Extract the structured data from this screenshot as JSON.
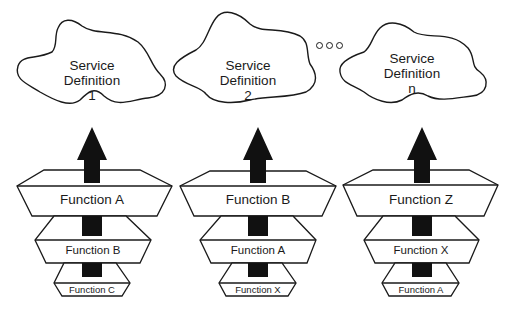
{
  "diagram": {
    "stroke_color": "#1a1a1a",
    "fill_color": "#ffffff",
    "arrow_color": "#111111",
    "columns": [
      {
        "cloud": {
          "line1": "Service",
          "line2": "Definition",
          "line3": "1"
        },
        "functions": {
          "top": "Function A",
          "middle": "Function B",
          "bottom": "Function C"
        }
      },
      {
        "cloud": {
          "line1": "Service",
          "line2": "Definition",
          "line3": "2"
        },
        "functions": {
          "top": "Function B",
          "middle": "Function A",
          "bottom": "Function X"
        }
      },
      {
        "cloud": {
          "line1": "Service",
          "line2": "Definition",
          "line3": "n"
        },
        "functions": {
          "top": "Function Z",
          "middle": "Function X",
          "bottom": "Function A"
        }
      }
    ],
    "ellipsis": "ooo"
  }
}
